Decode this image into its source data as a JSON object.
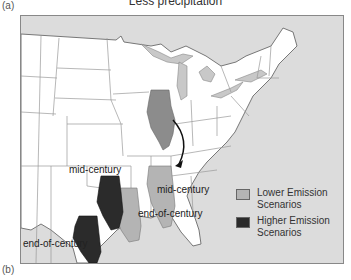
{
  "figure": {
    "panel_a_label": "(a)",
    "panel_b_label": "(b)",
    "title": "Less precipitation"
  },
  "map": {
    "annotations": [
      {
        "id": "mid-century-left",
        "text": "mid-century"
      },
      {
        "id": "mid-century-right",
        "text": "mid-century"
      },
      {
        "id": "end-of-century-right",
        "text": "end-of-century"
      },
      {
        "id": "end-of-century-left",
        "text": "end-of-century"
      }
    ],
    "colors": {
      "ocean": "#dcdcdc",
      "land": "#ffffff",
      "state_border": "#9a9a9a",
      "current_illinois": "#8c8c8c",
      "lower_emission": "#b4b4b4",
      "higher_emission": "#2b2b2b",
      "lakes": "#c8c8c8"
    }
  },
  "legend": {
    "items": [
      {
        "label_line1": "Lower Emission",
        "label_line2": "Scenarios",
        "color": "#b4b4b4"
      },
      {
        "label_line1": "Higher Emission",
        "label_line2": "Scenarios",
        "color": "#2b2b2b"
      }
    ]
  }
}
